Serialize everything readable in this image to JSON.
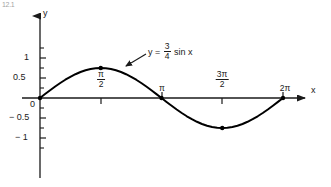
{
  "figure": {
    "corner_mark": "12.1",
    "background_color": "#ffffff",
    "ink_color": "#1a1a1a"
  },
  "chart_data": {
    "type": "line",
    "title": "",
    "subtitle": "",
    "xlabel": "x",
    "ylabel": "y",
    "equation_label": "y = 3/4 sin x",
    "equation_parts": {
      "lhs": "y",
      "equals": "=",
      "frac_num": "3",
      "frac_den": "4",
      "rhs": "sin x"
    },
    "grid": false,
    "legend": false,
    "amplitude": 0.75,
    "xlim": [
      0,
      6.283185307179586
    ],
    "ylim": [
      -1.25,
      1.25
    ],
    "x_tick_labels": [
      {
        "value": 1.5707963267948966,
        "display": "pi/2",
        "num": "π",
        "den": "2",
        "kind": "fraction"
      },
      {
        "value": 3.141592653589793,
        "display": "pi",
        "num": "π",
        "den": "",
        "kind": "plain"
      },
      {
        "value": 4.71238898038469,
        "display": "3pi/2",
        "num": "3π",
        "den": "2",
        "kind": "fraction"
      },
      {
        "value": 6.283185307179586,
        "display": "2pi",
        "num": "2π",
        "den": "",
        "kind": "plain"
      }
    ],
    "y_tick_labels": [
      {
        "value": 1,
        "display": "1"
      },
      {
        "value": 0.5,
        "display": "0.5"
      },
      {
        "value": 0,
        "display": "0"
      },
      {
        "value": -0.5,
        "display": "− 0.5"
      },
      {
        "value": -1,
        "display": "− 1"
      }
    ],
    "y_minor_ticks": [
      0.75,
      0.25,
      -0.25,
      -0.75
    ],
    "marked_points": [
      {
        "x": 0,
        "y": 0,
        "x_display": "0",
        "y_display": "0"
      },
      {
        "x": 1.5707963267948966,
        "y": 0.75,
        "x_display": "pi/2",
        "y_display": "0.75"
      },
      {
        "x": 3.141592653589793,
        "y": 0,
        "x_display": "pi",
        "y_display": "0"
      },
      {
        "x": 4.71238898038469,
        "y": -0.75,
        "x_display": "3pi/2",
        "y_display": "-0.75"
      },
      {
        "x": 6.283185307179586,
        "y": 0,
        "x_display": "2pi",
        "y_display": "0"
      }
    ],
    "series": [
      {
        "name": "y = 3/4 sin x",
        "color": "#000000",
        "x": [
          0.0,
          0.1309,
          0.2618,
          0.3927,
          0.5236,
          0.6545,
          0.7854,
          0.9163,
          1.0472,
          1.1781,
          1.309,
          1.4399,
          1.5708,
          1.7017,
          1.8326,
          1.9635,
          2.0944,
          2.2253,
          2.3562,
          2.4871,
          2.618,
          2.7489,
          2.8798,
          3.0107,
          3.1416,
          3.2725,
          3.4034,
          3.5343,
          3.6652,
          3.7961,
          3.927,
          4.0579,
          4.1888,
          4.3197,
          4.4506,
          4.5815,
          4.7124,
          4.8433,
          4.9742,
          5.1051,
          5.236,
          5.3669,
          5.4978,
          5.6287,
          5.7596,
          5.8905,
          6.0214,
          6.1523,
          6.2832
        ],
        "y": [
          0.0,
          0.0979,
          0.1941,
          0.287,
          0.375,
          0.4567,
          0.5303,
          0.5946,
          0.6495,
          0.6932,
          0.7244,
          0.7429,
          0.75,
          0.7429,
          0.7244,
          0.6932,
          0.6495,
          0.5946,
          0.5303,
          0.4567,
          0.375,
          0.287,
          0.1941,
          0.0979,
          0.0,
          -0.0979,
          -0.1941,
          -0.287,
          -0.375,
          -0.4567,
          -0.5303,
          -0.5946,
          -0.6495,
          -0.6932,
          -0.7244,
          -0.7429,
          -0.75,
          -0.7429,
          -0.7244,
          -0.6932,
          -0.6495,
          -0.5946,
          -0.5303,
          -0.4567,
          -0.375,
          -0.287,
          -0.1941,
          -0.0979,
          0.0
        ]
      }
    ],
    "annotation": {
      "text": "y = 3/4 sin x",
      "leader_from": [
        145,
        55
      ],
      "leader_to": [
        124,
        66
      ]
    }
  }
}
